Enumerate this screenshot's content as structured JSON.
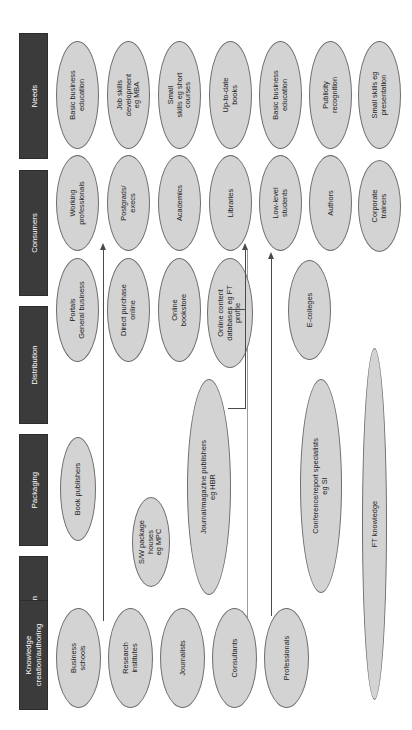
{
  "diagram": {
    "orientation": "rotated-90-ccw",
    "colors": {
      "stage_bar_fill": "#3b3b3b",
      "stage_bar_text": "#ffffff",
      "node_fill": "#d3d3d3",
      "node_stroke": "#6e6e6e",
      "connector": "#4a4a4a",
      "divider": "#9a9a9a",
      "background": "#ffffff"
    }
  },
  "stages": [
    {
      "id": "needs",
      "label": "Needs"
    },
    {
      "id": "consumers",
      "label": "Consumers"
    },
    {
      "id": "distribution",
      "label": "Distribution"
    },
    {
      "id": "packaging",
      "label": "Packaging"
    },
    {
      "id": "selection",
      "label": "Selection"
    },
    {
      "id": "knowledge",
      "label": "Knowledge\ncreation/authoring"
    }
  ],
  "nodes": {
    "needs": [
      {
        "id": "needs-1",
        "label": "Basic business\neducation"
      },
      {
        "id": "needs-2",
        "label": "Job skills\ndevelopment\neg MBA"
      },
      {
        "id": "needs-3",
        "label": "Small\nskills eg short\ncourses"
      },
      {
        "id": "needs-4",
        "label": "Up-to-date\nbooks"
      },
      {
        "id": "needs-5",
        "label": "Basic business\neducation"
      },
      {
        "id": "needs-6",
        "label": "Publicity\nrecognition"
      },
      {
        "id": "needs-7",
        "label": "Small skills eg\npresentation"
      }
    ],
    "consumers": [
      {
        "id": "consumers-1",
        "label": "Working\nprofessionals"
      },
      {
        "id": "consumers-2",
        "label": "Postgrads/\nexecs"
      },
      {
        "id": "consumers-3",
        "label": "Academics"
      },
      {
        "id": "consumers-4",
        "label": "Libraries"
      },
      {
        "id": "consumers-5",
        "label": "Low-level\nstudents"
      },
      {
        "id": "consumers-6",
        "label": "Authors"
      },
      {
        "id": "consumers-7",
        "label": "Corporate\ntrainers"
      }
    ],
    "distribution": [
      {
        "id": "distribution-1",
        "label": "Portals\nGeneral business"
      },
      {
        "id": "distribution-2",
        "label": "Direct purchase\nonline"
      },
      {
        "id": "distribution-3",
        "label": "Online\nbookstore"
      },
      {
        "id": "distribution-4",
        "label": "Online content\ndatabases eg FT\nprofile"
      },
      {
        "id": "distribution-5",
        "label": "E-colleges"
      }
    ],
    "packaging": [
      {
        "id": "packaging-1",
        "label": "Book publishers"
      },
      {
        "id": "packaging-2",
        "label": "Journal/magazine publishers\neg HBR"
      },
      {
        "id": "packaging-3",
        "label": "Conference/report specialists\neg SI"
      },
      {
        "id": "packaging-4",
        "label": "FT knowledge"
      }
    ],
    "selection": [
      {
        "id": "selection-1",
        "label": "S/W package\nhouses\neg MPC"
      }
    ],
    "knowledge": [
      {
        "id": "knowledge-1",
        "label": "Business\nschools"
      },
      {
        "id": "knowledge-2",
        "label": "Research\ninstitutes"
      },
      {
        "id": "knowledge-3",
        "label": "Journalists"
      },
      {
        "id": "knowledge-4",
        "label": "Consultants"
      },
      {
        "id": "knowledge-5",
        "label": "Professionals"
      }
    ]
  },
  "connectors": [
    {
      "id": "conn-business-schools",
      "from": "Business schools",
      "to": "Working professionals"
    },
    {
      "id": "conn-publishers-libraries",
      "from": "Journal/magazine publishers eg HBR",
      "to": "Libraries"
    },
    {
      "id": "conn-consultants",
      "from": "Consultants",
      "to": "Low-level students"
    }
  ]
}
